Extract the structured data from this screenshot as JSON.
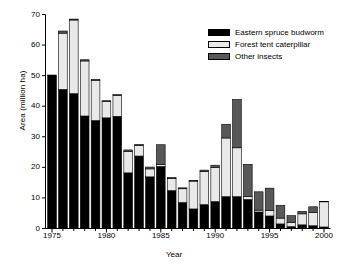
{
  "chart_data": {
    "type": "bar",
    "subtype": "stacked-bar",
    "title": "",
    "xlabel": "Year",
    "ylabel": "Area (million ha)",
    "xlim": [
      1974.4,
      2000.6
    ],
    "ylim": [
      0,
      70
    ],
    "ytick_values": [
      0,
      10,
      20,
      30,
      40,
      50,
      60,
      70
    ],
    "ytick_labels": [
      "0",
      "10",
      "20",
      "30",
      "40",
      "50",
      "60",
      "70"
    ],
    "xtick_values": [
      1975,
      1980,
      1985,
      1990,
      1995,
      2000
    ],
    "xtick_labels": [
      "1975",
      "1980",
      "1985",
      "1990",
      "1995",
      "2000"
    ],
    "grid": false,
    "legend_position": "top-right",
    "categories": [
      1975,
      1976,
      1977,
      1978,
      1979,
      1980,
      1981,
      1982,
      1983,
      1984,
      1985,
      1986,
      1987,
      1988,
      1989,
      1990,
      1991,
      1992,
      1993,
      1994,
      1995,
      1996,
      1997,
      1998,
      1999,
      2000
    ],
    "series": [
      {
        "name": "Eastern spruce budworm",
        "color": "#000000",
        "values": [
          50.2,
          45.5,
          44.1,
          36.8,
          35.3,
          36.2,
          36.7,
          18.2,
          23.7,
          16.9,
          20.3,
          12.4,
          8.5,
          6.4,
          7.8,
          8.8,
          10.4,
          10.4,
          9.5,
          5.4,
          4.1,
          1.5,
          0.6,
          1.2,
          0.9,
          0.5
        ]
      },
      {
        "name": "Forest tent caterpillar",
        "color": "#e9e9e9",
        "values": [
          0.0,
          18.4,
          24.1,
          18.0,
          13.2,
          5.3,
          6.8,
          7.0,
          3.4,
          2.6,
          0.6,
          3.9,
          4.5,
          9.1,
          10.9,
          11.2,
          19.2,
          16.0,
          0.9,
          0.6,
          1.8,
          1.9,
          1.4,
          3.6,
          4.4,
          8.3
        ]
      },
      {
        "name": "Other insects",
        "color": "#585858",
        "values": [
          0.0,
          0.7,
          0.3,
          0.4,
          0.2,
          0.3,
          0.3,
          0.5,
          0.4,
          0.6,
          6.5,
          0.4,
          0.3,
          0.2,
          0.4,
          0.7,
          4.5,
          15.8,
          10.6,
          6.0,
          7.3,
          4.2,
          2.2,
          0.8,
          1.8,
          0.1
        ]
      }
    ],
    "totals": [
      50.2,
      64.6,
      68.5,
      55.2,
      48.7,
      41.8,
      43.8,
      25.7,
      27.5,
      20.1,
      27.4,
      16.7,
      13.3,
      15.7,
      19.1,
      20.7,
      34.1,
      42.2,
      21.0,
      12.0,
      13.2,
      7.6,
      4.2,
      5.6,
      7.1,
      8.9
    ]
  },
  "legend": {
    "items": [
      {
        "label": "Eastern spruce budworm",
        "color": "#000000"
      },
      {
        "label": "Forest tent caterpillar",
        "color": "#e9e9e9"
      },
      {
        "label": "Other insects",
        "color": "#585858"
      }
    ]
  }
}
